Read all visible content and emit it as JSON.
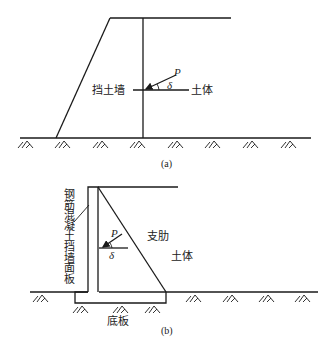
{
  "figure_a": {
    "caption": "(a)",
    "wall_label": "挡土墙",
    "soil_label": "土体",
    "force_label": "P",
    "angle_label": "δ",
    "hatch_x": [
      25,
      62,
      100,
      137,
      175,
      212,
      250,
      288
    ]
  },
  "figure_b": {
    "caption": "(b)",
    "face_panel_label_chars": [
      "钢",
      "筋",
      "混",
      "凝",
      "土",
      "挡",
      "墙",
      "面",
      "板"
    ],
    "rib_label": "支肋",
    "soil_label": "土体",
    "base_label": "底板",
    "force_label": "P",
    "angle_label": "δ",
    "hatch_x_left": [
      40
    ],
    "hatch_x_base": [
      80,
      120,
      152
    ],
    "hatch_x_right": [
      193,
      230,
      266,
      302
    ]
  }
}
